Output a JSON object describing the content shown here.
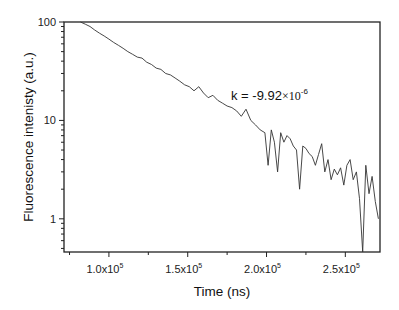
{
  "chart_data": {
    "type": "line",
    "title": "",
    "xlabel": "Time (ns)",
    "ylabel": "Fluorescence intenisty (a.u.)",
    "xscale": "linear",
    "yscale": "log",
    "xlim": [
      71500,
      272000
    ],
    "ylim": [
      0.46,
      100
    ],
    "x_ticks": [
      100000,
      150000,
      200000,
      250000
    ],
    "x_tick_labels": [
      {
        "mant": "1.0x10",
        "exp": "5"
      },
      {
        "mant": "1.5x10",
        "exp": "5"
      },
      {
        "mant": "2.0x10",
        "exp": "5"
      },
      {
        "mant": "2.5x10",
        "exp": "5"
      }
    ],
    "y_ticks": [
      1,
      10,
      100
    ],
    "y_tick_labels": [
      "1",
      "10",
      "100"
    ],
    "grid": false,
    "legend": null,
    "annotation": {
      "text": "k = -9.92",
      "times": "×10",
      "exp": "-6",
      "x": 200000,
      "y": 13
    },
    "series": [
      {
        "name": "decay",
        "x": [
          82000,
          85000,
          88000,
          91000,
          94000,
          97000,
          100000,
          103000,
          106000,
          109000,
          112000,
          115000,
          118000,
          121000,
          124000,
          127000,
          130000,
          133000,
          136000,
          139000,
          142000,
          145000,
          148000,
          151000,
          154000,
          157000,
          160000,
          163000,
          166000,
          169000,
          172000,
          175000,
          178000,
          181000,
          184000,
          187000,
          190000,
          193000,
          196000,
          199000,
          201000,
          203000,
          205000,
          207000,
          209000,
          211000,
          213000,
          215000,
          217000,
          219000,
          221000,
          223000,
          225000,
          227000,
          229000,
          231000,
          233000,
          235000,
          237000,
          239000,
          241000,
          243000,
          245000,
          247000,
          249000,
          251000,
          253000,
          255000,
          257000,
          259000,
          261000,
          263000,
          265000,
          267000,
          269000,
          271000
        ],
        "y": [
          100,
          95,
          90,
          83,
          77,
          72,
          67,
          62,
          58,
          54,
          50,
          47,
          44,
          43,
          39,
          37,
          34,
          33,
          30,
          29,
          27,
          25,
          23,
          22,
          20,
          22,
          19,
          17,
          18,
          16,
          15,
          14,
          13.5,
          12.5,
          11,
          13,
          10,
          9,
          8,
          7.5,
          3.5,
          8,
          6,
          3,
          7.5,
          6,
          7,
          6.5,
          5.5,
          5,
          2,
          5.5,
          5.2,
          4.6,
          4.3,
          3.5,
          4.5,
          5.8,
          3,
          4,
          2.5,
          3.2,
          2.8,
          3.3,
          2.2,
          3.5,
          4,
          2.5,
          3,
          1.6,
          0.45,
          3.5,
          1.8,
          2.7,
          1.5,
          1
        ]
      }
    ]
  },
  "style": {
    "line_color": "#333333",
    "axis_color": "#222222"
  }
}
